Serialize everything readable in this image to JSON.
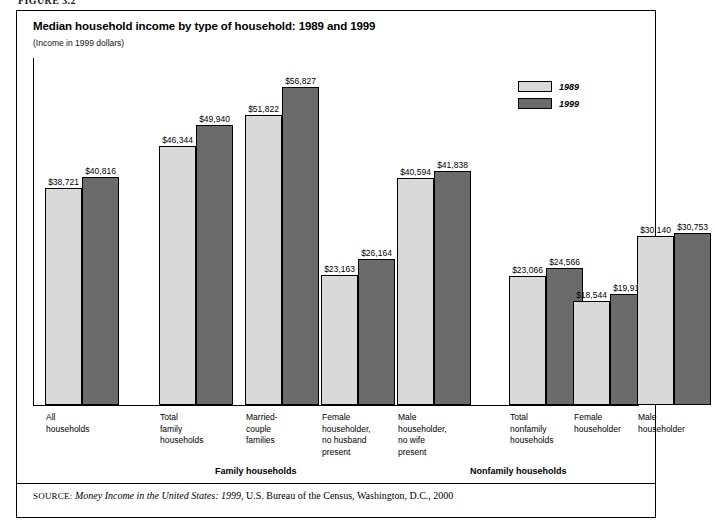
{
  "figure": {
    "number_label": "FIGURE 3.2"
  },
  "chart": {
    "title": "Median household income by type of household: 1989 and 1999",
    "subtitle": "(Income in 1999 dollars)"
  },
  "legend": {
    "items": [
      {
        "label": "1989",
        "color": "#d9d9d9"
      },
      {
        "label": "1999",
        "color": "#6b6b6b"
      }
    ]
  },
  "sections": [
    {
      "label": "Family households"
    },
    {
      "label": "Nonfamily households"
    }
  ],
  "source": {
    "prefix": "SOURCE:",
    "title": "Money Income in the United States: 1999",
    "rest": ", U.S. Bureau of the Census, Washington, D.C., 2000"
  },
  "chart_data": {
    "type": "bar",
    "title": "Median household income by type of household: 1989 and 1999",
    "subtitle": "(Income in 1999 dollars)",
    "xlabel": "",
    "ylabel": "Income in 1999 dollars",
    "ylim": [
      0,
      60000
    ],
    "grid": false,
    "legend_position": "top-right",
    "categories": [
      "All households",
      "Total family households",
      "Married-couple families",
      "Female householder, no husband present",
      "Male householder, no wife present",
      "Total nonfamily households",
      "Female householder",
      "Male householder"
    ],
    "category_lines": [
      [
        "All",
        "households"
      ],
      [
        "Total",
        "family",
        "households"
      ],
      [
        "Married-",
        "couple",
        "families"
      ],
      [
        "Female",
        "householder,",
        "no husband",
        "present"
      ],
      [
        "Male",
        "householder,",
        "no wife",
        "present"
      ],
      [
        "Total",
        "nonfamily",
        "households"
      ],
      [
        "Female",
        "householder"
      ],
      [
        "Male",
        "householder"
      ]
    ],
    "series": [
      {
        "name": "1989",
        "color": "#d9d9d9",
        "values": [
          38721,
          46344,
          51822,
          23163,
          40594,
          23066,
          18544,
          30140
        ],
        "labels": [
          "$38,721",
          "$46,344",
          "$51,822",
          "$23,163",
          "$40,594",
          "$23,066",
          "$18,544",
          "$30,140"
        ]
      },
      {
        "name": "1999",
        "color": "#6b6b6b",
        "values": [
          40816,
          49940,
          56827,
          26164,
          41838,
          24566,
          19917,
          30753
        ],
        "labels": [
          "$40,816",
          "$49,940",
          "$56,827",
          "$26,164",
          "$41,838",
          "$24,566",
          "$19,917",
          "$30,753"
        ]
      }
    ],
    "group_sections": [
      {
        "label": "Family households",
        "categories": [
          1,
          2,
          3,
          4
        ]
      },
      {
        "label": "Nonfamily households",
        "categories": [
          5,
          6,
          7
        ]
      }
    ]
  }
}
